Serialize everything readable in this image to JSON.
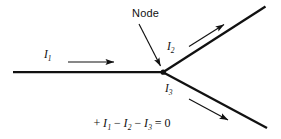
{
  "figure": {
    "title_label": "Node",
    "background_color": "#ffffff",
    "ink_color": "#111111",
    "node": {
      "label": "Node",
      "x": 163,
      "y": 72
    },
    "currents": [
      {
        "id": "I1",
        "symbol": "I",
        "subscript": "1",
        "direction": "into-node",
        "branch": "left-horizontal"
      },
      {
        "id": "I2",
        "symbol": "I",
        "subscript": "2",
        "direction": "out-of-node",
        "branch": "upper-right"
      },
      {
        "id": "I3",
        "symbol": "I",
        "subscript": "3",
        "direction": "out-of-node",
        "branch": "lower-right"
      }
    ],
    "equation": {
      "terms": [
        {
          "op": "+",
          "symbol": "I",
          "subscript": "1"
        },
        {
          "op": "−",
          "symbol": "I",
          "subscript": "2"
        },
        {
          "op": "−",
          "symbol": "I",
          "subscript": "3"
        }
      ],
      "relation": "=",
      "result": "0",
      "plain_text": "+I1 − I2 − I3 = 0"
    }
  }
}
